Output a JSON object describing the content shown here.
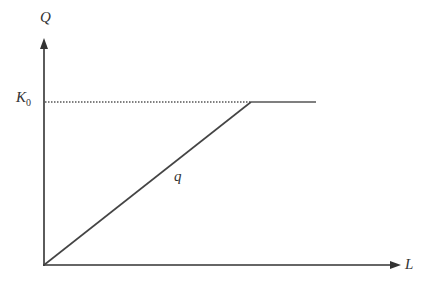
{
  "diagram": {
    "y_axis_label": "Q",
    "x_axis_label": "L",
    "capacity_label_main": "K",
    "capacity_label_sub": "0",
    "line_label": "q",
    "colors": {
      "axis": "#333333",
      "line": "#444444",
      "dotted": "#555555"
    },
    "geometry": {
      "origin": [
        44,
        265
      ],
      "y_axis_top": [
        44,
        40
      ],
      "x_axis_end": [
        400,
        265
      ],
      "capacity_y": 102,
      "kink": [
        251,
        102
      ],
      "flat_end": [
        316,
        102
      ]
    }
  }
}
